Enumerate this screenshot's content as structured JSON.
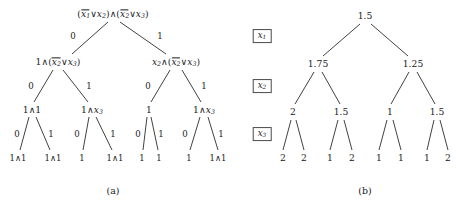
{
  "figure": {
    "panels": [
      {
        "id": "a",
        "caption": "(a)",
        "caption_x": 113,
        "caption_y": 190
      },
      {
        "id": "b",
        "caption": "(b)",
        "caption_x": 365,
        "caption_y": 190
      }
    ]
  },
  "level_labels": [
    {
      "name": "x1",
      "var": "x",
      "sub": "1",
      "x": 262,
      "y": 36
    },
    {
      "name": "x2",
      "var": "x",
      "sub": "2",
      "x": 262,
      "y": 86
    },
    {
      "name": "x3",
      "var": "x",
      "sub": "3",
      "x": 262,
      "y": 134
    }
  ],
  "tree_a": {
    "nodes": [
      {
        "id": "a0",
        "x": 113,
        "y": 14,
        "kind": "formula",
        "text": "( x̅1 ∨ x2 ) ∧ ( x̅2 ∨ x3 )",
        "html": "<span class=\"par\">(</span><span class=\"neg\">x<sub>1</sub></span><span class=\"op\">∨</span>x<sub>2</sub><span class=\"par\">)</span><span class=\"op\">∧</span><span class=\"par\">(</span><span class=\"neg\">x<sub>2</sub></span><span class=\"op\">∨</span>x<sub>3</sub><span class=\"par\">)</span>"
      },
      {
        "id": "a-L",
        "x": 58,
        "y": 62,
        "kind": "formula",
        "text": "1 ∧ ( x̅2 ∨ x3 )",
        "html": "<span class=\"num\">1</span><span class=\"op\">∧</span><span class=\"par\">(</span><span class=\"neg\">x<sub>2</sub></span><span class=\"op\">∨</span>x<sub>3</sub><span class=\"par\">)</span>"
      },
      {
        "id": "a-R",
        "x": 176,
        "y": 62,
        "kind": "formula",
        "text": "x2 ∧ ( x̅2 ∨ x3 )",
        "html": "x<sub>2</sub><span class=\"op\">∧</span><span class=\"par\">(</span><span class=\"neg\">x<sub>2</sub></span><span class=\"op\">∨</span>x<sub>3</sub><span class=\"par\">)</span>"
      },
      {
        "id": "a-LL",
        "x": 32,
        "y": 110,
        "kind": "formula",
        "text": "1 ∧ 1",
        "html": "<span class=\"num\">1</span><span class=\"op\">∧</span><span class=\"num\">1</span>"
      },
      {
        "id": "a-LR",
        "x": 92,
        "y": 110,
        "kind": "formula",
        "text": "1 ∧ x3",
        "html": "<span class=\"num\">1</span><span class=\"op\">∧</span>x<sub>3</sub>"
      },
      {
        "id": "a-RL",
        "x": 149,
        "y": 110,
        "kind": "formula",
        "text": "1",
        "html": "<span class=\"num\">1</span>"
      },
      {
        "id": "a-RR",
        "x": 204,
        "y": 110,
        "kind": "formula",
        "text": "1 ∧ x3",
        "html": "<span class=\"num\">1</span><span class=\"op\">∧</span>x<sub>3</sub>"
      },
      {
        "id": "a-LLL",
        "x": 18,
        "y": 158,
        "kind": "leaf",
        "text": "1 ∧ 1",
        "html": "<span class=\"num\">1</span><span class=\"op\">∧</span><span class=\"num\">1</span>"
      },
      {
        "id": "a-LLR",
        "x": 53,
        "y": 158,
        "kind": "leaf",
        "text": "1 ∧ 1",
        "html": "<span class=\"num\">1</span><span class=\"op\">∧</span><span class=\"num\">1</span>"
      },
      {
        "id": "a-LRL",
        "x": 82,
        "y": 158,
        "kind": "leaf",
        "text": "1",
        "html": "<span class=\"num\">1</span>"
      },
      {
        "id": "a-LRR",
        "x": 115,
        "y": 158,
        "kind": "leaf",
        "text": "1 ∧ 1",
        "html": "<span class=\"num\">1</span><span class=\"op\">∧</span><span class=\"num\">1</span>"
      },
      {
        "id": "a-RLL",
        "x": 142,
        "y": 158,
        "kind": "leaf",
        "text": "1",
        "html": "<span class=\"num\">1</span>"
      },
      {
        "id": "a-RLR",
        "x": 159,
        "y": 158,
        "kind": "leaf",
        "text": "1",
        "html": "<span class=\"num\">1</span>"
      },
      {
        "id": "a-RRL",
        "x": 189,
        "y": 158,
        "kind": "leaf",
        "text": "1",
        "html": "<span class=\"num\">1</span>"
      },
      {
        "id": "a-RRR",
        "x": 218,
        "y": 158,
        "kind": "leaf",
        "text": "1 ∧ 1",
        "html": "<span class=\"num\">1</span><span class=\"op\">∧</span><span class=\"num\">1</span>"
      }
    ],
    "edges": [
      {
        "from": "a0",
        "to": "a-L",
        "x1": 108,
        "y1": 22,
        "x2": 72,
        "y2": 54,
        "label": "0",
        "lx": 73,
        "ly": 36
      },
      {
        "from": "a0",
        "to": "a-R",
        "x1": 120,
        "y1": 22,
        "x2": 166,
        "y2": 54,
        "label": "1",
        "lx": 160,
        "ly": 36
      },
      {
        "from": "a-L",
        "to": "a-LL",
        "x1": 53,
        "y1": 70,
        "x2": 34,
        "y2": 102,
        "label": "0",
        "lx": 31,
        "ly": 86
      },
      {
        "from": "a-L",
        "to": "a-LR",
        "x1": 63,
        "y1": 70,
        "x2": 88,
        "y2": 102,
        "label": "1",
        "lx": 89,
        "ly": 86
      },
      {
        "from": "a-R",
        "to": "a-RL",
        "x1": 170,
        "y1": 70,
        "x2": 151,
        "y2": 102,
        "label": "0",
        "lx": 148,
        "ly": 86
      },
      {
        "from": "a-R",
        "to": "a-RR",
        "x1": 182,
        "y1": 70,
        "x2": 201,
        "y2": 102,
        "label": "1",
        "lx": 204,
        "ly": 86
      },
      {
        "from": "a-LL",
        "to": "a-LLL",
        "x1": 29,
        "y1": 117,
        "x2": 20,
        "y2": 150,
        "label": "0",
        "lx": 17,
        "ly": 134
      },
      {
        "from": "a-LL",
        "to": "a-LLR",
        "x1": 36,
        "y1": 117,
        "x2": 50,
        "y2": 150,
        "label": "1",
        "lx": 51,
        "ly": 134
      },
      {
        "from": "a-LR",
        "to": "a-LRL",
        "x1": 89,
        "y1": 117,
        "x2": 83,
        "y2": 150,
        "label": "0",
        "lx": 77,
        "ly": 134
      },
      {
        "from": "a-LR",
        "to": "a-LRR",
        "x1": 96,
        "y1": 117,
        "x2": 112,
        "y2": 150,
        "label": "1",
        "lx": 113,
        "ly": 134
      },
      {
        "from": "a-RL",
        "to": "a-RLL",
        "x1": 147,
        "y1": 117,
        "x2": 143,
        "y2": 150,
        "label": "0",
        "lx": 138,
        "ly": 134
      },
      {
        "from": "a-RL",
        "to": "a-RLR",
        "x1": 151,
        "y1": 117,
        "x2": 158,
        "y2": 150,
        "label": "1",
        "lx": 161,
        "ly": 134
      },
      {
        "from": "a-RR",
        "to": "a-RRL",
        "x1": 200,
        "y1": 117,
        "x2": 190,
        "y2": 150,
        "label": "0",
        "lx": 185,
        "ly": 134
      },
      {
        "from": "a-RR",
        "to": "a-RRR",
        "x1": 208,
        "y1": 117,
        "x2": 218,
        "y2": 150,
        "label": "1",
        "lx": 221,
        "ly": 134
      }
    ]
  },
  "tree_b": {
    "nodes": [
      {
        "id": "b0",
        "x": 365,
        "y": 16,
        "text": "1.5"
      },
      {
        "id": "b-L",
        "x": 318,
        "y": 64,
        "text": "1.75"
      },
      {
        "id": "b-R",
        "x": 413,
        "y": 64,
        "text": "1.25"
      },
      {
        "id": "b-LL",
        "x": 293,
        "y": 112,
        "text": "2"
      },
      {
        "id": "b-LR",
        "x": 341,
        "y": 112,
        "text": "1.5"
      },
      {
        "id": "b-RL",
        "x": 390,
        "y": 112,
        "text": "1"
      },
      {
        "id": "b-RR",
        "x": 437,
        "y": 112,
        "text": "1.5"
      },
      {
        "id": "b-LLL",
        "x": 283,
        "y": 158,
        "text": "2"
      },
      {
        "id": "b-LLR",
        "x": 304,
        "y": 158,
        "text": "2"
      },
      {
        "id": "b-LRL",
        "x": 330,
        "y": 158,
        "text": "1"
      },
      {
        "id": "b-LRR",
        "x": 352,
        "y": 158,
        "text": "2"
      },
      {
        "id": "b-RLL",
        "x": 379,
        "y": 158,
        "text": "1"
      },
      {
        "id": "b-RLR",
        "x": 401,
        "y": 158,
        "text": "1"
      },
      {
        "id": "b-RRL",
        "x": 427,
        "y": 158,
        "text": "1"
      },
      {
        "id": "b-RRR",
        "x": 448,
        "y": 158,
        "text": "2"
      }
    ],
    "edges": [
      {
        "from": "b0",
        "to": "b-L",
        "x1": 360,
        "y1": 24,
        "x2": 323,
        "y2": 56
      },
      {
        "from": "b0",
        "to": "b-R",
        "x1": 371,
        "y1": 24,
        "x2": 408,
        "y2": 56
      },
      {
        "from": "b-L",
        "to": "b-LL",
        "x1": 314,
        "y1": 72,
        "x2": 295,
        "y2": 104
      },
      {
        "from": "b-L",
        "to": "b-LR",
        "x1": 322,
        "y1": 72,
        "x2": 340,
        "y2": 104
      },
      {
        "from": "b-R",
        "to": "b-RL",
        "x1": 409,
        "y1": 72,
        "x2": 391,
        "y2": 104
      },
      {
        "from": "b-R",
        "to": "b-RR",
        "x1": 417,
        "y1": 72,
        "x2": 435,
        "y2": 104
      },
      {
        "from": "b-LL",
        "to": "b-LLL",
        "x1": 291,
        "y1": 120,
        "x2": 283,
        "y2": 150
      },
      {
        "from": "b-LL",
        "to": "b-LLR",
        "x1": 296,
        "y1": 120,
        "x2": 304,
        "y2": 150
      },
      {
        "from": "b-LR",
        "to": "b-LRL",
        "x1": 338,
        "y1": 120,
        "x2": 330,
        "y2": 150
      },
      {
        "from": "b-LR",
        "to": "b-LRR",
        "x1": 344,
        "y1": 120,
        "x2": 352,
        "y2": 150
      },
      {
        "from": "b-RL",
        "to": "b-RLL",
        "x1": 387,
        "y1": 120,
        "x2": 379,
        "y2": 150
      },
      {
        "from": "b-RL",
        "to": "b-RLR",
        "x1": 393,
        "y1": 120,
        "x2": 401,
        "y2": 150
      },
      {
        "from": "b-RR",
        "to": "b-RRL",
        "x1": 434,
        "y1": 120,
        "x2": 427,
        "y2": 150
      },
      {
        "from": "b-RR",
        "to": "b-RRR",
        "x1": 440,
        "y1": 120,
        "x2": 448,
        "y2": 150
      }
    ]
  },
  "chart_data": {
    "type": "diagram",
    "title": "",
    "subtitle": "",
    "branching_variables": [
      "x1",
      "x2",
      "x3"
    ],
    "edge_labels": [
      "0",
      "1"
    ],
    "panels": [
      {
        "id": "a",
        "caption": "(a)",
        "type": "formula-tree",
        "levels": [
          {
            "depth": 0,
            "variable": null,
            "labels": [
              "(x̅1 ∨ x2) ∧ (x̅2 ∨ x3)"
            ]
          },
          {
            "depth": 1,
            "variable": "x1",
            "labels": [
              "1 ∧ (x̅2 ∨ x3)",
              "x2 ∧ (x̅2 ∨ x3)"
            ]
          },
          {
            "depth": 2,
            "variable": "x2",
            "labels": [
              "1 ∧ 1",
              "1 ∧ x3",
              "1",
              "1 ∧ x3"
            ]
          },
          {
            "depth": 3,
            "variable": "x3",
            "labels": [
              "1 ∧ 1",
              "1 ∧ 1",
              "1",
              "1 ∧ 1",
              "1",
              "1",
              "1",
              "1 ∧ 1"
            ]
          }
        ]
      },
      {
        "id": "b",
        "caption": "(b)",
        "type": "value-tree",
        "levels": [
          {
            "depth": 0,
            "variable": null,
            "values": [
              1.5
            ]
          },
          {
            "depth": 1,
            "variable": "x1",
            "values": [
              1.75,
              1.25
            ]
          },
          {
            "depth": 2,
            "variable": "x2",
            "values": [
              2,
              1.5,
              1,
              1.5
            ]
          },
          {
            "depth": 3,
            "variable": "x3",
            "values": [
              2,
              2,
              1,
              2,
              1,
              1,
              1,
              2
            ]
          }
        ]
      }
    ]
  }
}
